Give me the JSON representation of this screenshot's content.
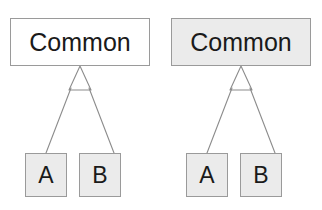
{
  "figure": {
    "background_color": "#ffffff",
    "line_color": "#8c8c8c",
    "border_color": "#9a9a9a",
    "text_color": "#1a1a1a",
    "fill_white": "#ffffff",
    "fill_gray": "#ebebeb"
  },
  "diagrams": [
    {
      "id": "left",
      "parent": {
        "label": "Common",
        "fill": "#ffffff"
      },
      "children": [
        {
          "label": "A",
          "fill": "#ebebeb"
        },
        {
          "label": "B",
          "fill": "#ebebeb"
        }
      ],
      "relationship": "generalization"
    },
    {
      "id": "right",
      "parent": {
        "label": "Common",
        "fill": "#ebebeb"
      },
      "children": [
        {
          "label": "A",
          "fill": "#ebebeb"
        },
        {
          "label": "B",
          "fill": "#ebebeb"
        }
      ],
      "relationship": "generalization"
    }
  ]
}
